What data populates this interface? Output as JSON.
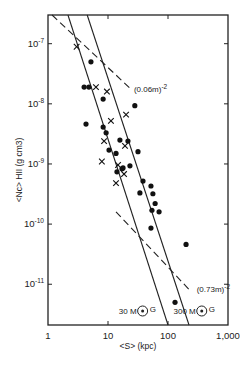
{
  "chart_data": {
    "type": "scatter",
    "title": "",
    "xlabel": "<S> (kpc)",
    "ylabel": "<Nc> HII (g cm3)",
    "xscale": "log",
    "yscale": "log",
    "xlim": [
      1,
      1000
    ],
    "ylim": [
      2.1e-12,
      3e-07
    ],
    "grid": false,
    "x_ticks": [
      {
        "value": 1,
        "label": "1"
      },
      {
        "value": 10,
        "label": "10"
      },
      {
        "value": 100,
        "label": "100"
      },
      {
        "value": 1000,
        "label": "1,000"
      }
    ],
    "y_ticks": [
      {
        "value": 1e-07,
        "base": "10",
        "exp": "-7"
      },
      {
        "value": 1e-08,
        "base": "10",
        "exp": "-8"
      },
      {
        "value": 1e-09,
        "base": "10",
        "exp": "-9"
      },
      {
        "value": 1e-10,
        "base": "10",
        "exp": "-10"
      },
      {
        "value": 1e-11,
        "base": "10",
        "exp": "-11"
      }
    ],
    "series": [
      {
        "name": "dots",
        "marker": "filled-circle",
        "points": [
          [
            5.2,
            5e-08
          ],
          [
            4.0,
            1.9e-08
          ],
          [
            4.8,
            1.9e-08
          ],
          [
            8.3,
            1.2e-08
          ],
          [
            28,
            9.3e-09
          ],
          [
            4.3,
            4.6e-09
          ],
          [
            8.3,
            4.1e-09
          ],
          [
            9.3,
            3.3e-09
          ],
          [
            15.8,
            2.5e-09
          ],
          [
            21.5,
            2.4e-09
          ],
          [
            31.6,
            1.6e-09
          ],
          [
            10.4,
            1.7e-09
          ],
          [
            13.6,
            1.5e-09
          ],
          [
            23.2,
            9.3e-10
          ],
          [
            17.1,
            8.3e-10
          ],
          [
            14.1,
            7.4e-10
          ],
          [
            17.8,
            8.6e-10
          ],
          [
            38.3,
            5.2e-10
          ],
          [
            52,
            4.3e-10
          ],
          [
            34,
            3.3e-10
          ],
          [
            56,
            3.2e-10
          ],
          [
            61,
            2.2e-10
          ],
          [
            54,
            1.7e-10
          ],
          [
            71,
            1.6e-10
          ],
          [
            52,
            8.6e-11
          ],
          [
            200,
            4.6e-11
          ],
          [
            131,
            5e-12
          ]
        ]
      },
      {
        "name": "crosses",
        "marker": "x",
        "points": [
          [
            3.0,
            8.9e-08
          ],
          [
            6.3,
            1.9e-08
          ],
          [
            9.6,
            1.6e-08
          ],
          [
            20,
            6.6e-09
          ],
          [
            11.2,
            5.2e-09
          ],
          [
            8.6,
            2.4e-09
          ],
          [
            19.2,
            2e-09
          ],
          [
            7.9,
            1.1e-09
          ],
          [
            14.7,
            9.6e-10
          ],
          [
            18.5,
            6.8e-10
          ],
          [
            13.6,
            4.8e-10
          ]
        ]
      }
    ],
    "lines": [
      {
        "name": "dashed-006",
        "style": "dashed",
        "from": [
          1.17,
          3e-07
        ],
        "to": [
          25,
          1.7e-08
        ],
        "label": "(0.06m)",
        "label_exp": "-2",
        "label_at": [
          27,
          1.6e-08
        ]
      },
      {
        "name": "dashed-073",
        "style": "dashed",
        "from": [
          13.6,
          1.6e-10
        ],
        "to": [
          232,
          7.9e-12
        ],
        "label": "(0.73m)",
        "label_exp": "-2",
        "label_at": [
          240,
          7.5e-12
        ]
      },
      {
        "name": "solid-30MG",
        "style": "solid",
        "from": [
          2.15,
          3e-07
        ],
        "to": [
          100,
          2.1e-12
        ],
        "label": "30 M",
        "label_sub": "G",
        "label_at": [
          30,
          3.2e-12
        ]
      },
      {
        "name": "solid-300MG",
        "style": "solid",
        "from": [
          4.5,
          3e-07
        ],
        "to": [
          224,
          2.1e-12
        ],
        "label": "300 M",
        "label_sub": "G",
        "label_at": [
          290,
          3.2e-12
        ]
      }
    ]
  }
}
